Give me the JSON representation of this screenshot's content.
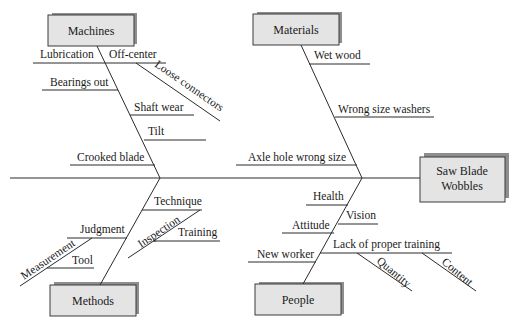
{
  "diagram": {
    "type": "fishbone",
    "effect": {
      "line1": "Saw Blade",
      "line2": "Wobbles"
    },
    "categories": {
      "machines": {
        "label": "Machines",
        "causes": {
          "lubrication": "Lubrication",
          "off_center": "Off-center",
          "loose_connectors": "Loose connectors",
          "bearings_out": "Bearings out",
          "shaft_wear": "Shaft wear",
          "tilt": "Tilt",
          "crooked_blade": "Crooked blade"
        }
      },
      "materials": {
        "label": "Materials",
        "causes": {
          "wet_wood": "Wet wood",
          "wrong_size_washers": "Wrong size washers",
          "axle_hole_wrong_size": "Axle hole wrong size"
        }
      },
      "methods": {
        "label": "Methods",
        "causes": {
          "technique": "Technique",
          "inspection": "Inspection",
          "training": "Training",
          "judgment": "Judgment",
          "measurement": "Measurement",
          "tool": "Tool"
        }
      },
      "people": {
        "label": "People",
        "causes": {
          "health": "Health",
          "vision": "Vision",
          "attitude": "Attitude",
          "lack_of_training": "Lack of proper training",
          "quantity": "Quantity",
          "content": "Content",
          "new_worker": "New worker"
        }
      }
    }
  }
}
